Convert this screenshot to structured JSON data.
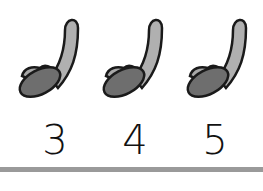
{
  "items": [
    {
      "shape": "banana-sock-icon",
      "number": "3"
    },
    {
      "shape": "banana-sock-icon",
      "number": "4"
    },
    {
      "shape": "banana-sock-icon",
      "number": "5"
    }
  ],
  "colors": {
    "light_fill": "#b0b0b0",
    "dark_fill": "#6e6e6e",
    "outline": "#1a1a1a",
    "bar": "#9a9a9a"
  }
}
